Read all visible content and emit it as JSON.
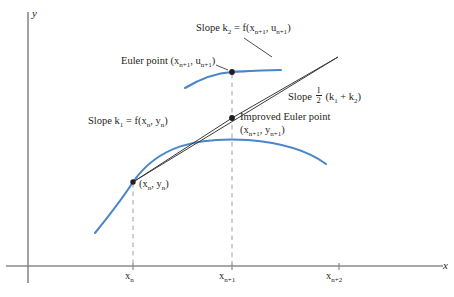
{
  "figure": {
    "axes": {
      "y_label": "y",
      "x_label": "x",
      "x_axis_y": 266,
      "y_axis_x": 28,
      "x_ticks": [
        {
          "label_html": "x<sub>n</sub>",
          "label_text": "x_n",
          "x": 133
        },
        {
          "label_html": "x<sub>n+1</sub>",
          "label_text": "x_n+1",
          "x": 232
        },
        {
          "label_html": "x<sub>n+2</sub>",
          "label_text": "x_n+2",
          "x": 339
        }
      ]
    },
    "labels": {
      "euler_point": "Euler point (x<sub>n+1</sub>, u<sub>n+1</sub>)",
      "euler_point_text": "Euler point (x_n+1, u_n+1)",
      "slope_k2": "Slope k<sub>2</sub> = f(x<sub>n+1</sub>, u<sub>n+1</sub>)",
      "slope_k2_text": "Slope k_2 = f(x_n+1, u_n+1)",
      "slope_k1": "Slope k<sub>1</sub> = f(x<sub>n</sub>, y<sub>n</sub>)",
      "slope_k1_text": "Slope k_1 = f(x_n, y_n)",
      "slope_avg_prefix": "Slope",
      "slope_avg_num": "1",
      "slope_avg_den": "2",
      "slope_avg_suffix": "(k<sub>1</sub> + k<sub>2</sub>)",
      "slope_avg_text": "Slope 1/2 (k_1 + k_2)",
      "improved_euler_line1": "Improved Euler point",
      "improved_euler_line2": "(x<sub>n+1</sub>, y<sub>n+1</sub>)",
      "improved_euler_line2_text": "(x_n+1, y_n+1)",
      "base_point": "(x<sub>n</sub>, y<sub>n</sub>)",
      "base_point_text": "(x_n, y_n)"
    },
    "colors": {
      "curve_blue": "#4a86c8",
      "axis_gray": "#8a8a8a",
      "line_black": "#3a3a3a",
      "dash_gray": "#a8a8a8",
      "text": "#231f20",
      "background": "#ffffff"
    },
    "points": [
      {
        "name": "base-point",
        "x": 133,
        "y": 182
      },
      {
        "name": "euler-point",
        "x": 232,
        "y": 72
      },
      {
        "name": "improved-euler-point",
        "x": 232,
        "y": 118
      }
    ],
    "geometry": {
      "k1_line": "M 133 182 L 338 57",
      "avg_slope_line": "M 133 182 L 232 118 L 338 57",
      "solution_curve": "M 95 233 C 112 212 124 196 133 182 C 158 146 196 137 248 140 C 285 143 310 152 326 164",
      "tangent_arc": "M 185 88 C 200 79 216 73 232 72 C 252 71 268 70 281 70",
      "leader_k2": "M 245 38 L 272 56",
      "leader_euler_point": "M 218 66 L 229 71"
    }
  }
}
